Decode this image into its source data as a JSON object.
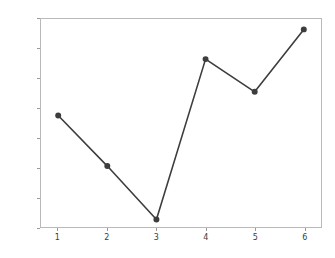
{
  "chart_data": {
    "type": "line",
    "title": "",
    "xlabel": "",
    "ylabel": "",
    "x": [
      1,
      2,
      3,
      4,
      5,
      6
    ],
    "values": [
      25.5,
      22.1,
      18.5,
      29.3,
      27.1,
      31.3
    ],
    "xlim": [
      0.65,
      6.35
    ],
    "ylim": [
      18,
      32
    ],
    "xticks": [
      1,
      2,
      3,
      4,
      5,
      6
    ],
    "yticks": [
      18,
      20,
      22,
      24,
      26,
      28,
      30,
      32
    ],
    "xtick_labels": [
      "1",
      "2",
      "3",
      "4",
      "5",
      "6"
    ],
    "ytick_labels": [
      "18",
      "20",
      "22",
      "24",
      "26",
      "28",
      "30",
      "32"
    ],
    "grid": false,
    "legend": null,
    "marker": "circle",
    "line_color": "#3d3d3d",
    "marker_color": "#3d3d3d",
    "background_color": "#ffffff",
    "axis_color": "#b9b9b9"
  }
}
